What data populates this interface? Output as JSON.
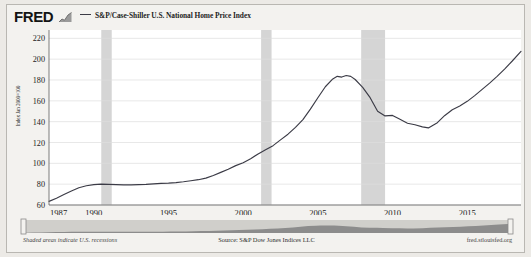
{
  "header": {
    "logo_text": "FRED",
    "logo_icon": "bar-chart-icon",
    "legend": [
      {
        "label": "S&P/Case-Shiller U.S. National Home Price Index",
        "color": "#3b3b46"
      }
    ]
  },
  "footer": {
    "left_note": "Shaded areas indicate U.S. recessions",
    "source": "Source: S&P Dow Jones Indices LLC",
    "site": "fred.stlouisfed.org"
  },
  "chart_data": {
    "type": "line",
    "title": "",
    "subtitle": "",
    "xlabel": "",
    "ylabel": "Index Jan 2000=100",
    "xlim": [
      1987.0,
      2018.6
    ],
    "ylim": [
      60,
      228
    ],
    "yticks": [
      60,
      80,
      100,
      120,
      140,
      160,
      180,
      200,
      220
    ],
    "xticks": [
      1987,
      1990,
      1995,
      2000,
      2005,
      2010,
      2015
    ],
    "grid": true,
    "legend_position": "top",
    "line_color": "#3b3b46",
    "plot_background": "#ffffff",
    "recession_band_color": "#d5d5d5",
    "recessions": [
      {
        "start": 1990.5,
        "end": 1991.2
      },
      {
        "start": 2001.2,
        "end": 2001.9
      },
      {
        "start": 2007.9,
        "end": 2009.5
      }
    ],
    "series": [
      {
        "name": "S&P/Case-Shiller U.S. National Home Price Index",
        "x": [
          1987.0,
          1987.5,
          1988.0,
          1988.5,
          1989.0,
          1989.5,
          1990.0,
          1990.5,
          1991.0,
          1991.5,
          1992.0,
          1992.5,
          1993.0,
          1993.5,
          1994.0,
          1994.5,
          1995.0,
          1995.5,
          1996.0,
          1996.5,
          1997.0,
          1997.5,
          1998.0,
          1998.5,
          1999.0,
          1999.5,
          2000.0,
          2000.5,
          2001.0,
          2001.5,
          2002.0,
          2002.5,
          2003.0,
          2003.5,
          2004.0,
          2004.5,
          2005.0,
          2005.5,
          2006.0,
          2006.3,
          2006.6,
          2006.9,
          2007.2,
          2007.5,
          2008.0,
          2008.5,
          2009.0,
          2009.5,
          2010.0,
          2010.4,
          2011.0,
          2011.5,
          2012.0,
          2012.4,
          2013.0,
          2013.5,
          2014.0,
          2014.5,
          2015.0,
          2015.5,
          2016.0,
          2016.5,
          2017.0,
          2017.5,
          2018.0,
          2018.6
        ],
        "y": [
          63.5,
          66.5,
          70.0,
          73.5,
          76.5,
          78.5,
          79.5,
          80.0,
          79.8,
          79.5,
          79.3,
          79.3,
          79.5,
          79.8,
          80.3,
          80.8,
          81.0,
          81.5,
          82.3,
          83.3,
          84.3,
          85.8,
          88.3,
          91.3,
          94.3,
          97.8,
          100.5,
          104.5,
          109.0,
          113.0,
          117.0,
          122.5,
          128.0,
          134.5,
          142.0,
          152.0,
          163.0,
          173.5,
          181.0,
          183.5,
          182.8,
          184.3,
          183.5,
          180.5,
          173.0,
          163.0,
          150.0,
          145.5,
          146.0,
          143.0,
          138.5,
          137.0,
          135.0,
          134.0,
          139.0,
          146.0,
          151.5,
          155.0,
          159.5,
          165.0,
          171.0,
          177.0,
          183.5,
          190.5,
          198.0,
          207.5
        ]
      }
    ]
  },
  "navigator": {
    "name": "range-selector",
    "left_handle": "left-range-handle",
    "right_handle": "right-range-handle",
    "fill_color": "#8c8c8c"
  }
}
